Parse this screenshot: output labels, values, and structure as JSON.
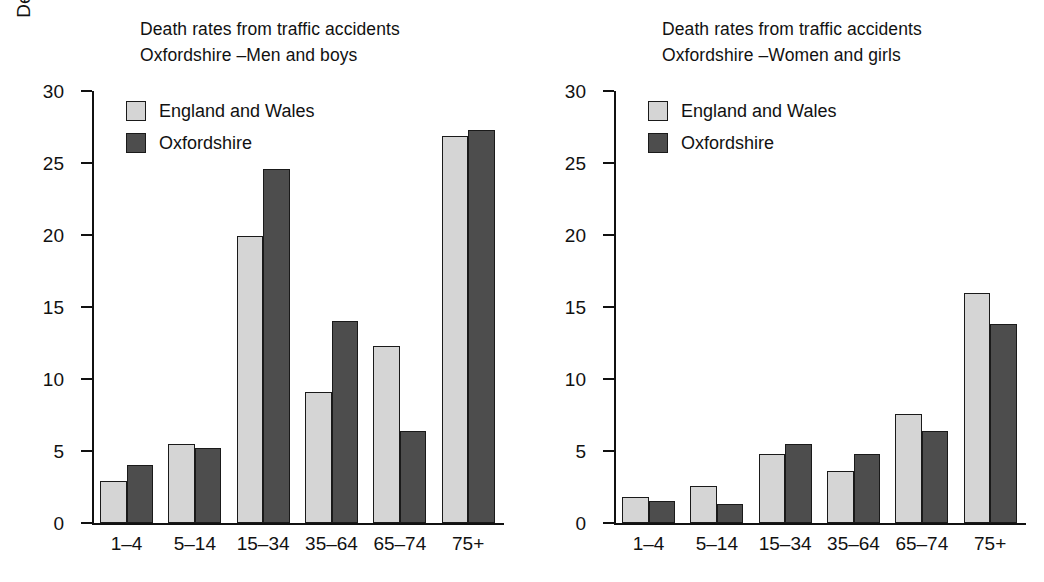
{
  "figure": {
    "panels": [
      "left",
      "right"
    ]
  },
  "chart_data": [
    {
      "type": "bar",
      "panel": "left",
      "title": "Death rates from traffic accidents\nOxfordshire –Men and boys",
      "title_line1": "Death rates from traffic accidents",
      "title_line2": "Oxfordshire –Men and boys",
      "xlabel": "",
      "ylabel": "Deaths per 100,000 people",
      "categories": [
        "1–4",
        "5–14",
        "15–34",
        "35–64",
        "65–74",
        "75+"
      ],
      "series": [
        {
          "name": "England and Wales",
          "color": "#d5d5d5",
          "values": [
            2.9,
            5.5,
            19.9,
            9.1,
            12.3,
            26.9
          ]
        },
        {
          "name": "Oxfordshire",
          "color": "#4d4d4d",
          "values": [
            4.0,
            5.2,
            24.6,
            14.0,
            6.4,
            27.3
          ]
        }
      ],
      "ylim": [
        0,
        30
      ],
      "yticks": [
        0,
        5,
        10,
        15,
        20,
        25,
        30
      ],
      "ytick_labels": [
        "0",
        "5",
        "10",
        "15",
        "20",
        "25",
        "30"
      ],
      "grid": false,
      "legend_position": "top-left"
    },
    {
      "type": "bar",
      "panel": "right",
      "title": "Death rates from traffic accidents\nOxfordshire –Women and girls",
      "title_line1": "Death rates from traffic accidents",
      "title_line2": "Oxfordshire –Women and girls",
      "xlabel": "",
      "ylabel": "Deaths per 100,000",
      "categories": [
        "1–4",
        "5–14",
        "15–34",
        "35–64",
        "65–74",
        "75+"
      ],
      "series": [
        {
          "name": "England and Wales",
          "color": "#d5d5d5",
          "values": [
            1.8,
            2.6,
            4.8,
            3.6,
            7.6,
            16.0
          ]
        },
        {
          "name": "Oxfordshire",
          "color": "#4d4d4d",
          "values": [
            1.5,
            1.3,
            5.5,
            4.8,
            6.4,
            13.8
          ]
        }
      ],
      "ylim": [
        0,
        30
      ],
      "yticks": [
        0,
        5,
        10,
        15,
        20,
        25,
        30
      ],
      "ytick_labels": [
        "0",
        "5",
        "10",
        "15",
        "20",
        "25",
        "30"
      ],
      "grid": false,
      "legend_position": "top-left"
    }
  ]
}
